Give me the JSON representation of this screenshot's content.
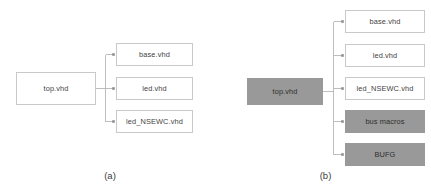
{
  "figure": {
    "type": "block-hierarchy-diagram",
    "background": "#ffffff",
    "box_border_color": "#c9c9c9",
    "box_fill_white": "#ffffff",
    "box_fill_gray": "#999999",
    "edge_color": "#b6b6b6",
    "text_color": "#3f3f3f"
  },
  "panels": [
    {
      "id": "a",
      "caption": "(a)",
      "root": {
        "label": "top.vhd",
        "style": "white"
      },
      "children": [
        {
          "label": "base.vhd",
          "style": "white"
        },
        {
          "label": "led.vhd",
          "style": "white"
        },
        {
          "label": "led_NSEWC.vhd",
          "style": "white"
        }
      ]
    },
    {
      "id": "b",
      "caption": "(b)",
      "root": {
        "label": "top.vhd",
        "style": "gray"
      },
      "children": [
        {
          "label": "base.vhd",
          "style": "white"
        },
        {
          "label": "led.vhd",
          "style": "white"
        },
        {
          "label": "led_NSEWC.vhd",
          "style": "white"
        },
        {
          "label": "bus macros",
          "style": "gray"
        },
        {
          "label": "BUFG",
          "style": "gray"
        }
      ]
    }
  ]
}
